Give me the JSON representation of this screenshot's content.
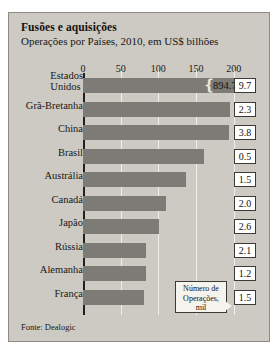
{
  "chart_data": {
    "type": "bar",
    "orientation": "horizontal",
    "title": "Fusões e aquisições",
    "subtitle": "Operações por Países, 2010, em US$ bilhões",
    "xlabel": "",
    "ylabel": "",
    "xlim": [
      0,
      215
    ],
    "xticks": [
      0,
      50,
      100,
      150,
      200
    ],
    "grid": true,
    "legend": false,
    "categories": [
      "Estados Unidos",
      "Grã-Bretanha",
      "China",
      "Brasil",
      "Austrália",
      "Canadá",
      "Japão",
      "Rússia",
      "Alemanha",
      "França"
    ],
    "series": [
      {
        "name": "Valor das operações (US$ bilhões)",
        "values": [
          894.7,
          195,
          194,
          160,
          137,
          110,
          101,
          83,
          83,
          81
        ]
      },
      {
        "name": "Número de Operações, mil",
        "values": [
          9.7,
          2.3,
          3.8,
          0.5,
          1.5,
          2.0,
          2.6,
          2.1,
          1.2,
          1.5
        ]
      }
    ],
    "broken_bar": {
      "category": "Estados Unidos",
      "label": "894.7",
      "note": "eixo truncado"
    },
    "annotations": [
      {
        "text": "Número de Operações, mil",
        "target": "coluna de valores à direita"
      }
    ],
    "source": "Fonte: Dealogic",
    "colors": {
      "background": "#cccac3",
      "bar": "#7d7b76",
      "gridline": "#efeee9",
      "axis": "#20201e",
      "box_fill": "#ffffff",
      "text": "#14110e"
    }
  },
  "chart": {
    "title": "Fusões e aquisições",
    "subtitle": "Operações por Países, 2010, em US$ bilhões",
    "source": "Fonte: Dealogic",
    "callout_line1": "Número de",
    "callout_line2": "Operações,",
    "callout_line3": "mil",
    "ticks": [
      "0",
      "50",
      "100",
      "150",
      "200"
    ],
    "rows": [
      {
        "label_line1": "Estados",
        "label_line2": "Unidos",
        "value": "894.7",
        "ops": "9.7"
      },
      {
        "label_line1": "Grã-Bretanha",
        "label_line2": "",
        "value": "",
        "ops": "2.3"
      },
      {
        "label_line1": "China",
        "label_line2": "",
        "value": "",
        "ops": "3.8"
      },
      {
        "label_line1": "Brasil",
        "label_line2": "",
        "value": "",
        "ops": "0.5"
      },
      {
        "label_line1": "Austrália",
        "label_line2": "",
        "value": "",
        "ops": "1.5"
      },
      {
        "label_line1": "Canadá",
        "label_line2": "",
        "value": "",
        "ops": "2.0"
      },
      {
        "label_line1": "Japão",
        "label_line2": "",
        "value": "",
        "ops": "2.6"
      },
      {
        "label_line1": "Rússia",
        "label_line2": "",
        "value": "",
        "ops": "2.1"
      },
      {
        "label_line1": "Alemanha",
        "label_line2": "",
        "value": "",
        "ops": "1.2"
      },
      {
        "label_line1": "França",
        "label_line2": "",
        "value": "",
        "ops": "1.5"
      }
    ]
  }
}
